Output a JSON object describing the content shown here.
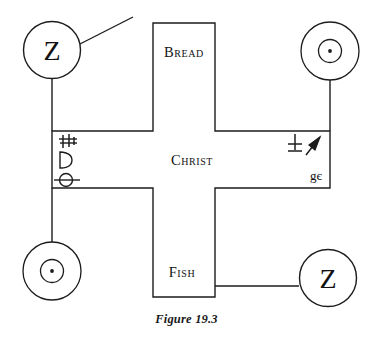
{
  "figure": {
    "caption": "Figure 19.3",
    "cross": {
      "center_label": "Christ",
      "top_label": "Bread",
      "bottom_label": "Fish"
    },
    "nodes": [
      {
        "id": "top-left",
        "position": "top-left",
        "symbol_name": "letter-z-glyph",
        "label": "Z"
      },
      {
        "id": "top-right",
        "position": "top-right",
        "symbol_name": "sun-circle-dot-glyph",
        "label": ""
      },
      {
        "id": "bottom-left",
        "position": "bottom-left",
        "symbol_name": "sun-circle-dot-glyph",
        "label": ""
      },
      {
        "id": "bottom-right",
        "position": "bottom-right",
        "symbol_name": "letter-z-glyph",
        "label": "Z"
      }
    ],
    "left_arm_marks": [
      {
        "id": "mark-1",
        "name": "double-barred-rune-glyph",
        "label": "☨"
      },
      {
        "id": "mark-2",
        "name": "letter-d-glyph",
        "label": "D"
      },
      {
        "id": "mark-3",
        "name": "barred-circle-glyph",
        "label": "Θ"
      }
    ],
    "right_arm_marks": [
      {
        "id": "mark-4",
        "name": "plus-cross-glyph",
        "label": "✚"
      },
      {
        "id": "mark-5",
        "name": "arrow-flag-glyph",
        "label": "➤"
      },
      {
        "id": "mark-6",
        "name": "g-e-ligature-glyph",
        "label": "gє"
      }
    ],
    "connectors": [
      {
        "id": "pointer-line",
        "name": "diagonal-pointer-line"
      },
      {
        "id": "left-vertical",
        "name": "left-vertical-connector"
      },
      {
        "id": "right-vertical",
        "name": "right-vertical-connector"
      },
      {
        "id": "bottom-right-horizontal",
        "name": "bottom-right-horizontal-connector"
      }
    ],
    "colors": {
      "stroke": "#1c1c1c",
      "background": "#ffffff",
      "text": "#111111"
    }
  }
}
